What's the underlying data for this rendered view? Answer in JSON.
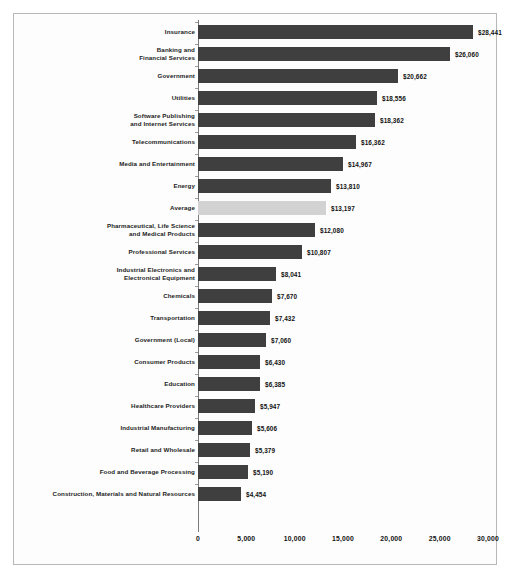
{
  "chart_data": {
    "type": "bar",
    "orientation": "horizontal",
    "title": "",
    "subtitle": "",
    "xlabel": "",
    "ylabel": "",
    "xlim": [
      0,
      30000
    ],
    "grid": false,
    "legend": false,
    "x_ticks": [
      "0",
      "5,000",
      "10,000",
      "15,000",
      "20,000",
      "25,000",
      "30,000"
    ],
    "x_tick_values": [
      0,
      5000,
      10000,
      15000,
      20000,
      25000,
      30000
    ],
    "colors": {
      "bar": "#3f3f3f",
      "highlight_bar": "#d2d2d2",
      "frame": "#b8b8b8",
      "axis": "#7a7a7a",
      "text": "#121212",
      "background": "#fdfdfd"
    },
    "highlight_category": "Average",
    "categories": [
      "Insurance",
      "Banking and Financial Services",
      "Government",
      "Utilities",
      "Software Publishing and Internet Services",
      "Telecommunications",
      "Media and Entertainment",
      "Energy",
      "Average",
      "Pharmaceutical, Life Science and Medical Products",
      "Professional Services",
      "Industrial Electronics and Electronical Equipment",
      "Chemicals",
      "Transportation",
      "Government (Local)",
      "Consumer Products",
      "Education",
      "Healthcare Providers",
      "Industrial Manufacturing",
      "Retail and Wholesale",
      "Food and Beverage Processing",
      "Construction, Materials and Natural Resources"
    ],
    "values": [
      28441,
      26060,
      20662,
      18556,
      18362,
      16362,
      14967,
      13810,
      13197,
      12080,
      10807,
      8041,
      7670,
      7432,
      7060,
      6430,
      6385,
      5947,
      5606,
      5379,
      5190,
      4454
    ],
    "value_labels": [
      "$28,441",
      "$26,060",
      "$20,662",
      "$18,556",
      "$18,362",
      "$16,362",
      "$14,967",
      "$13,810",
      "$13,197",
      "$12,080",
      "$10,807",
      "$8,041",
      "$7,670",
      "$7,432",
      "$7,060",
      "$6,430",
      "$6,385",
      "$5,947",
      "$5,606",
      "$5,379",
      "$5,190",
      "$4,454"
    ],
    "rows": [
      {
        "label_lines": [
          "Insurance"
        ],
        "value": 28441,
        "value_label": "$28,441",
        "highlight": false
      },
      {
        "label_lines": [
          "Banking and",
          "Financial Services"
        ],
        "value": 26060,
        "value_label": "$26,060",
        "highlight": false
      },
      {
        "label_lines": [
          "Government"
        ],
        "value": 20662,
        "value_label": "$20,662",
        "highlight": false
      },
      {
        "label_lines": [
          "Utilities"
        ],
        "value": 18556,
        "value_label": "$18,556",
        "highlight": false
      },
      {
        "label_lines": [
          "Software Publishing",
          "and Internet Services"
        ],
        "value": 18362,
        "value_label": "$18,362",
        "highlight": false
      },
      {
        "label_lines": [
          "Telecommunications"
        ],
        "value": 16362,
        "value_label": "$16,362",
        "highlight": false
      },
      {
        "label_lines": [
          "Media and Entertainment"
        ],
        "value": 14967,
        "value_label": "$14,967",
        "highlight": false
      },
      {
        "label_lines": [
          "Energy"
        ],
        "value": 13810,
        "value_label": "$13,810",
        "highlight": false
      },
      {
        "label_lines": [
          "Average"
        ],
        "value": 13197,
        "value_label": "$13,197",
        "highlight": true
      },
      {
        "label_lines": [
          "Pharmaceutical, Life Science",
          "and Medical Products"
        ],
        "value": 12080,
        "value_label": "$12,080",
        "highlight": false
      },
      {
        "label_lines": [
          "Professional Services"
        ],
        "value": 10807,
        "value_label": "$10,807",
        "highlight": false
      },
      {
        "label_lines": [
          "Industrial Electronics and",
          "Electronical Equipment"
        ],
        "value": 8041,
        "value_label": "$8,041",
        "highlight": false
      },
      {
        "label_lines": [
          "Chemicals"
        ],
        "value": 7670,
        "value_label": "$7,670",
        "highlight": false
      },
      {
        "label_lines": [
          "Transportation"
        ],
        "value": 7432,
        "value_label": "$7,432",
        "highlight": false
      },
      {
        "label_lines": [
          "Government (Local)"
        ],
        "value": 7060,
        "value_label": "$7,060",
        "highlight": false
      },
      {
        "label_lines": [
          "Consumer Products"
        ],
        "value": 6430,
        "value_label": "$6,430",
        "highlight": false
      },
      {
        "label_lines": [
          "Education"
        ],
        "value": 6385,
        "value_label": "$6,385",
        "highlight": false
      },
      {
        "label_lines": [
          "Healthcare Providers"
        ],
        "value": 5947,
        "value_label": "$5,947",
        "highlight": false
      },
      {
        "label_lines": [
          "Industrial Manufacturing"
        ],
        "value": 5606,
        "value_label": "$5,606",
        "highlight": false
      },
      {
        "label_lines": [
          "Retail and Wholesale"
        ],
        "value": 5379,
        "value_label": "$5,379",
        "highlight": false
      },
      {
        "label_lines": [
          "Food and Beverage Processing"
        ],
        "value": 5190,
        "value_label": "$5,190",
        "highlight": false
      },
      {
        "label_lines": [
          "Construction,  Materials and Natural Resources"
        ],
        "value": 4454,
        "value_label": "$4,454",
        "highlight": false
      }
    ]
  }
}
